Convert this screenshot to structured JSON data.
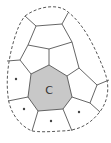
{
  "diagram": {
    "type": "cell-tessellation",
    "center_cell": {
      "label": "C",
      "fill": "#c8c8c8",
      "vertices": [
        [
          49,
          65
        ],
        [
          67,
          76
        ],
        [
          72,
          97
        ],
        [
          63,
          109
        ],
        [
          38,
          111
        ],
        [
          28,
          97
        ],
        [
          31,
          74
        ]
      ]
    },
    "marked_cells": [
      {
        "marker": "*",
        "x": 16,
        "y": 79
      },
      {
        "marker": "*",
        "x": 24,
        "y": 109
      },
      {
        "marker": "*",
        "x": 51,
        "y": 121
      },
      {
        "marker": "*",
        "x": 79,
        "y": 112
      }
    ],
    "boundary": {
      "style": "dashed",
      "color": "#444444"
    },
    "edge_color": "#555555"
  }
}
